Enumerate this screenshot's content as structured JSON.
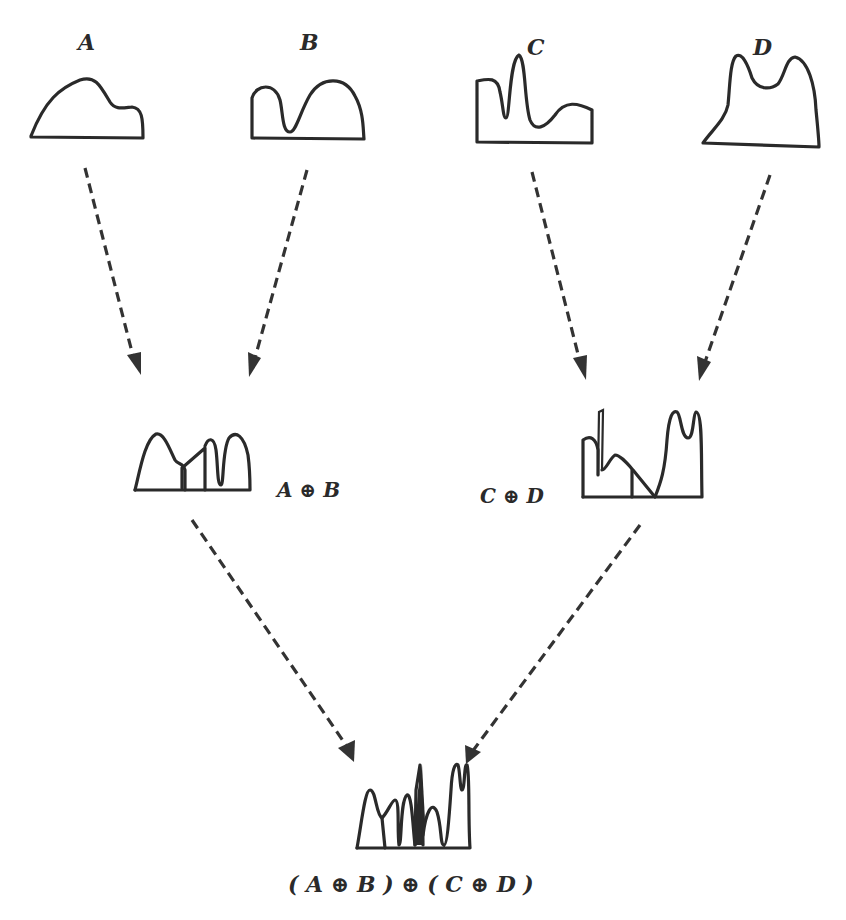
{
  "diagram": {
    "type": "merge-tree",
    "leaves": [
      {
        "id": "A",
        "label": "A"
      },
      {
        "id": "B",
        "label": "B"
      },
      {
        "id": "C",
        "label": "C"
      },
      {
        "id": "D",
        "label": "D"
      }
    ],
    "intermediate": [
      {
        "id": "AB",
        "label": "A ⊕ B",
        "inputs": [
          "A",
          "B"
        ]
      },
      {
        "id": "CD",
        "label": "C ⊕ D",
        "inputs": [
          "C",
          "D"
        ]
      }
    ],
    "result": {
      "id": "ABCD",
      "label": "( A ⊕ B ) ⊕ ( C ⊕ D )",
      "inputs": [
        "AB",
        "CD"
      ]
    },
    "edges": [
      {
        "from": "A",
        "to": "AB",
        "style": "dashed-arrow"
      },
      {
        "from": "B",
        "to": "AB",
        "style": "dashed-arrow"
      },
      {
        "from": "C",
        "to": "CD",
        "style": "dashed-arrow"
      },
      {
        "from": "D",
        "to": "CD",
        "style": "dashed-arrow"
      },
      {
        "from": "AB",
        "to": "ABCD",
        "style": "dashed-arrow"
      },
      {
        "from": "CD",
        "to": "ABCD",
        "style": "dashed-arrow"
      }
    ]
  }
}
